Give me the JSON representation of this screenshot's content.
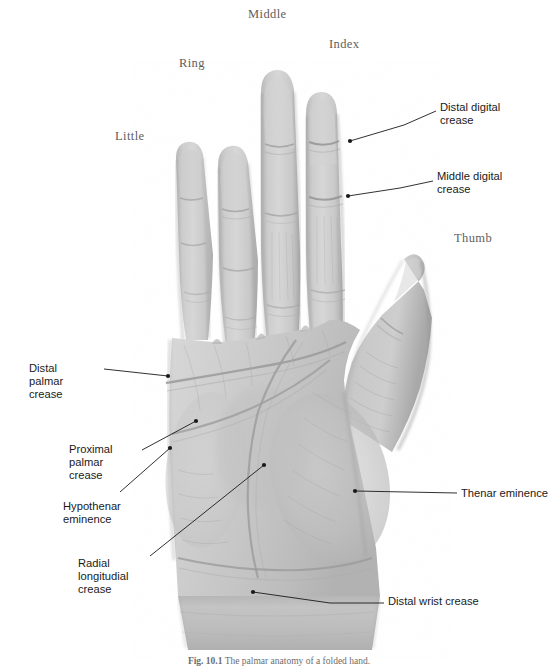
{
  "figure": {
    "background_color": "#ffffff",
    "skin_color_light": "#d2d2d2",
    "skin_color_mid": "#c0c0c0",
    "skin_color_dark": "#9a9a9a",
    "leader_color": "#1a1a1a",
    "finger_label_color": "#5e5e5e",
    "annotation_color": "#1a1a1a"
  },
  "finger_labels": [
    {
      "id": "middle",
      "text": "Middle",
      "x": 248,
      "y": 8
    },
    {
      "id": "index",
      "text": "Index",
      "x": 329,
      "y": 38
    },
    {
      "id": "ring",
      "text": "Ring",
      "x": 179,
      "y": 57
    },
    {
      "id": "little",
      "text": "Little",
      "x": 115,
      "y": 130
    },
    {
      "id": "thumb",
      "text": "Thumb",
      "x": 454,
      "y": 232
    }
  ],
  "annotations": [
    {
      "id": "distal-digital-crease",
      "text": "Distal digital\ncrease",
      "side": "right",
      "label_x": 440,
      "label_y": 101,
      "leader": [
        [
          350,
          141
        ],
        [
          404,
          125
        ],
        [
          436,
          111
        ]
      ],
      "dot": [
        350,
        141
      ]
    },
    {
      "id": "middle-digital-crease",
      "text": "Middle digital\ncrease",
      "side": "right",
      "label_x": 437,
      "label_y": 170,
      "leader": [
        [
          348,
          196
        ],
        [
          400,
          188
        ],
        [
          433,
          181
        ]
      ],
      "dot": [
        348,
        196
      ]
    },
    {
      "id": "thenar-eminence",
      "text": "Thenar eminence",
      "side": "right",
      "label_x": 461,
      "label_y": 487,
      "leader": [
        [
          355,
          491
        ],
        [
          457,
          493
        ]
      ],
      "dot": [
        355,
        491
      ]
    },
    {
      "id": "distal-wrist-crease",
      "text": "Distal wrist crease",
      "side": "right",
      "label_x": 388,
      "label_y": 595,
      "leader": [
        [
          253,
          592
        ],
        [
          330,
          603
        ],
        [
          384,
          603
        ]
      ],
      "dot": [
        253,
        592
      ]
    },
    {
      "id": "distal-palmar-crease",
      "text": "Distal\npalmar\ncrease",
      "side": "left",
      "label_x": 29,
      "label_y": 362,
      "leader": [
        [
          168,
          376
        ],
        [
          104,
          369
        ]
      ],
      "dot": [
        168,
        376
      ]
    },
    {
      "id": "proximal-palmar-crease",
      "text": "Proximal\npalmar\ncrease",
      "side": "left",
      "label_x": 69,
      "label_y": 443,
      "leader": [
        [
          196,
          421
        ],
        [
          142,
          450
        ]
      ],
      "dot": [
        196,
        421
      ]
    },
    {
      "id": "hypothenar-eminence",
      "text": "Hypothenar\neminence",
      "side": "left",
      "label_x": 63,
      "label_y": 500,
      "leader": [
        [
          170,
          448
        ],
        [
          120,
          492
        ]
      ],
      "dot": [
        170,
        448
      ]
    },
    {
      "id": "radial-longitudinal-crease",
      "text": "Radial\nlongitudial\ncrease",
      "side": "left",
      "label_x": 78,
      "label_y": 557,
      "leader": [
        [
          264,
          465
        ],
        [
          150,
          556
        ]
      ],
      "dot": [
        264,
        465
      ]
    }
  ],
  "caption": {
    "number": "Fig. 10.1",
    "text": "The palmar anatomy of a folded hand."
  }
}
